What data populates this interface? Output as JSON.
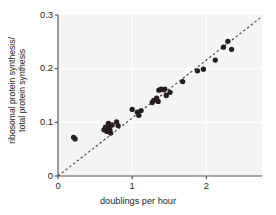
{
  "figure": {
    "background": "#ffffff",
    "plot_background": "#f4f4f4",
    "axis_color": "#58595b",
    "grid_color": "#ffffff",
    "point_color": "#231f20",
    "trend_color": "#404041"
  },
  "chart_data": {
    "type": "scatter",
    "title": "",
    "xlabel": "doublings per hour",
    "ylabel": "ribosomal protein synthesis/\ntotal protein synthesis",
    "xlim": [
      0,
      2.75
    ],
    "ylim": [
      0,
      0.3
    ],
    "xticks": [
      0,
      1,
      2
    ],
    "xticklabels": [
      "0",
      "1",
      "2"
    ],
    "yticks": [
      0,
      0.1,
      0.2,
      0.3
    ],
    "yticklabels": [
      "0",
      "0.1",
      "0.2",
      "0.3"
    ],
    "grid": true,
    "legend": null,
    "annotations": [],
    "trendline": {
      "style": "dashed",
      "x": [
        0.0,
        2.74
      ],
      "y": [
        0.0,
        0.296
      ]
    },
    "points": [
      {
        "x": 0.21,
        "y": 0.072
      },
      {
        "x": 0.23,
        "y": 0.069
      },
      {
        "x": 0.62,
        "y": 0.086
      },
      {
        "x": 0.64,
        "y": 0.091
      },
      {
        "x": 0.66,
        "y": 0.083
      },
      {
        "x": 0.68,
        "y": 0.098
      },
      {
        "x": 0.69,
        "y": 0.092
      },
      {
        "x": 0.7,
        "y": 0.086
      },
      {
        "x": 0.71,
        "y": 0.08
      },
      {
        "x": 0.73,
        "y": 0.095
      },
      {
        "x": 0.79,
        "y": 0.101
      },
      {
        "x": 0.81,
        "y": 0.094
      },
      {
        "x": 1.0,
        "y": 0.124
      },
      {
        "x": 1.07,
        "y": 0.119
      },
      {
        "x": 1.09,
        "y": 0.113
      },
      {
        "x": 1.12,
        "y": 0.122
      },
      {
        "x": 1.27,
        "y": 0.137
      },
      {
        "x": 1.29,
        "y": 0.141
      },
      {
        "x": 1.33,
        "y": 0.145
      },
      {
        "x": 1.35,
        "y": 0.139
      },
      {
        "x": 1.36,
        "y": 0.16
      },
      {
        "x": 1.39,
        "y": 0.162
      },
      {
        "x": 1.41,
        "y": 0.161
      },
      {
        "x": 1.44,
        "y": 0.162
      },
      {
        "x": 1.46,
        "y": 0.15
      },
      {
        "x": 1.51,
        "y": 0.156
      },
      {
        "x": 1.68,
        "y": 0.176
      },
      {
        "x": 1.88,
        "y": 0.196
      },
      {
        "x": 1.96,
        "y": 0.199
      },
      {
        "x": 2.12,
        "y": 0.216
      },
      {
        "x": 2.23,
        "y": 0.24
      },
      {
        "x": 2.29,
        "y": 0.251
      },
      {
        "x": 2.34,
        "y": 0.236
      }
    ]
  },
  "axis_labels": {
    "x": "doublings per hour",
    "y_line1": "ribosomal protein synthesis/",
    "y_line2": "total protein synthesis"
  }
}
